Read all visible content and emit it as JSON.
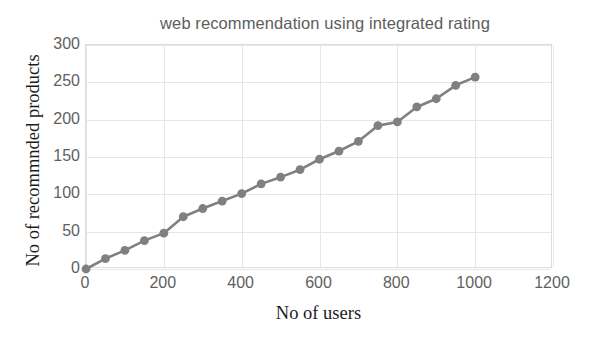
{
  "chart_data": {
    "type": "line",
    "title": "web recommendation using integrated rating",
    "xlabel": "No of users",
    "ylabel": "No of recommnded products",
    "x": [
      0,
      50,
      100,
      150,
      200,
      250,
      300,
      350,
      400,
      450,
      500,
      550,
      600,
      650,
      700,
      750,
      800,
      850,
      900,
      950,
      1000
    ],
    "values": [
      0,
      14,
      25,
      38,
      48,
      70,
      81,
      91,
      101,
      114,
      123,
      133,
      147,
      158,
      171,
      192,
      197,
      217,
      228,
      246,
      257
    ],
    "series": [
      {
        "name": "No of recommnded products",
        "values": [
          0,
          14,
          25,
          38,
          48,
          70,
          81,
          91,
          101,
          114,
          123,
          133,
          147,
          158,
          171,
          192,
          197,
          217,
          228,
          246,
          257
        ]
      }
    ],
    "xlim": [
      0,
      1200
    ],
    "ylim": [
      0,
      300
    ],
    "xticks": [
      0,
      200,
      400,
      600,
      800,
      1000,
      1200
    ],
    "yticks": [
      0,
      50,
      100,
      150,
      200,
      250,
      300
    ],
    "xtick_labels": [
      "0",
      "200",
      "400",
      "600",
      "800",
      "1000",
      "1200"
    ],
    "ytick_labels": [
      "0",
      "50",
      "100",
      "150",
      "200",
      "250",
      "300"
    ],
    "grid": true,
    "legend": false,
    "legend_position": "none",
    "marker": "circle",
    "line_color": "#808080",
    "marker_color": "#808080",
    "grid_color": "#e6e6e6",
    "tick_label_color": "#5f5f5f",
    "title_color": "#5d5d5d",
    "axis_title_color": "#1c1c1c",
    "background_color": "#ffffff"
  }
}
